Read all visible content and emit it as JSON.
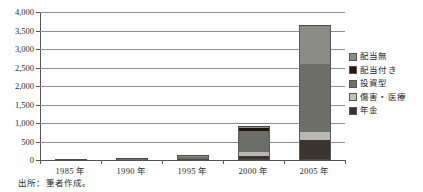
{
  "header_ghost": "",
  "source_note": "出所：筆者作成。",
  "chart_data": {
    "type": "bar",
    "subtype": "stacked-vertical",
    "title": "",
    "xlabel": "",
    "ylabel": "",
    "ylim": [
      0,
      4000
    ],
    "ytick_step": 500,
    "grid": true,
    "legend_position": "right",
    "categories": [
      "1985 年",
      "1990 年",
      "1995 年",
      "2000 年",
      "2005 年"
    ],
    "ytick_labels": [
      "0",
      "500",
      "1,000",
      "1,500",
      "2,000",
      "2,500",
      "3,000",
      "3,500",
      "4,000"
    ],
    "ytick_values": [
      0,
      500,
      1000,
      1500,
      2000,
      2500,
      3000,
      3500,
      4000
    ],
    "series": [
      {
        "name": "年金",
        "color": "#3a332e",
        "legend_color": "#3a332e",
        "values": [
          2,
          6,
          18,
          120,
          550
        ]
      },
      {
        "name": "傷害・医療",
        "color": "#b9b9b4",
        "legend_color": "#c2c2bd",
        "values": [
          1,
          4,
          14,
          95,
          200
        ]
      },
      {
        "name": "投資型",
        "color": "#6e6e68",
        "legend_color": "#6e6e68",
        "values": [
          1,
          5,
          40,
          560,
          1850
        ]
      },
      {
        "name": "配当付き",
        "color": "#20150f",
        "legend_color": "#2a1510",
        "values": [
          1,
          14,
          22,
          90,
          0
        ]
      },
      {
        "name": "配当無",
        "color": "#8c8c86",
        "legend_color": "#8c8c86",
        "values": [
          0,
          1,
          6,
          35,
          1020
        ]
      }
    ],
    "totals": [
      5,
      30,
      100,
      900,
      3620
    ],
    "stack_order_bottom_to_top": [
      "年金",
      "傷害・医療",
      "投資型",
      "配当付き",
      "配当無"
    ],
    "legend_order_top_to_bottom": [
      "配当無",
      "配当付き",
      "投資型",
      "傷害・医療",
      "年金"
    ]
  }
}
